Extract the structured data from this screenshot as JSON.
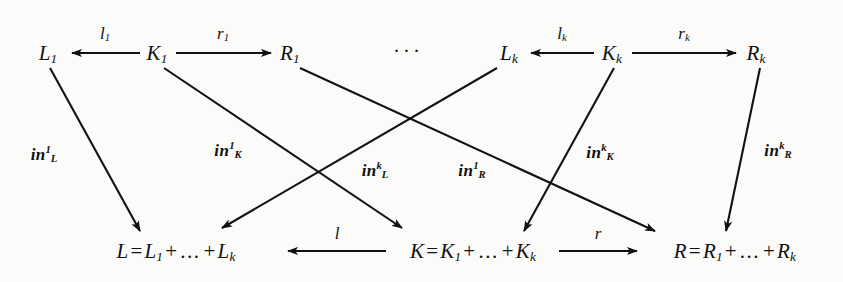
{
  "figure": {
    "kind": "commutative-diagram",
    "background_color": "#fbfbfa",
    "ink_color": "#111111",
    "ellipsis": "···"
  },
  "nodes": {
    "top_left_L": {
      "base": "L",
      "sub": "1"
    },
    "top_left_K": {
      "base": "K",
      "sub": "1"
    },
    "top_left_R": {
      "base": "R",
      "sub": "1"
    },
    "top_right_L": {
      "base": "L",
      "sub": "k"
    },
    "top_right_K": {
      "base": "K",
      "sub": "k"
    },
    "top_right_R": {
      "base": "R",
      "sub": "k"
    },
    "bottom_L": {
      "lhs": "L",
      "eq": "=",
      "term1_base": "L",
      "term1_sub": "1",
      "plus1": "+",
      "dots": "...",
      "plus2": "+",
      "term2_base": "L",
      "term2_sub": "k"
    },
    "bottom_K": {
      "lhs": "K",
      "eq": "=",
      "term1_base": "K",
      "term1_sub": "1",
      "plus1": "+",
      "dots": "...",
      "plus2": "+",
      "term2_base": "K",
      "term2_sub": "k"
    },
    "bottom_R": {
      "lhs": "R",
      "eq": "=",
      "term1_base": "R",
      "term1_sub": "1",
      "plus1": "+",
      "dots": "...",
      "plus2": "+",
      "term2_base": "R",
      "term2_sub": "k"
    }
  },
  "arrow_labels": {
    "l1": {
      "base": "l",
      "sub": "1"
    },
    "r1": {
      "base": "r",
      "sub": "1"
    },
    "lk": {
      "base": "l",
      "sub": "k"
    },
    "rk": {
      "base": "r",
      "sub": "k"
    },
    "l_bottom": {
      "base": "l"
    },
    "r_bottom": {
      "base": "r"
    }
  },
  "injection_labels": {
    "in_L_1": {
      "base": "in",
      "sup": "1",
      "sub": "L"
    },
    "in_K_1": {
      "base": "in",
      "sup": "1",
      "sub": "K"
    },
    "in_L_k": {
      "base": "in",
      "sup": "k",
      "sub": "L"
    },
    "in_R_1": {
      "base": "in",
      "sup": "1",
      "sub": "R"
    },
    "in_K_k": {
      "base": "in",
      "sup": "k",
      "sub": "K"
    },
    "in_R_k": {
      "base": "in",
      "sup": "k",
      "sub": "R"
    }
  }
}
